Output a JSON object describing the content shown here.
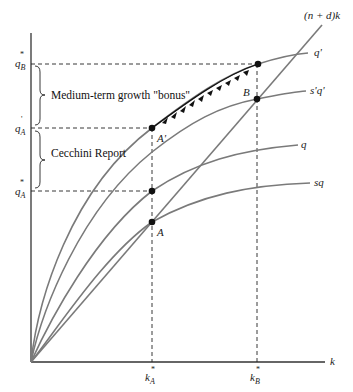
{
  "diagram": {
    "type": "growth-model",
    "axes": {
      "x_label": "k",
      "y_tick_labels": [
        {
          "id": "qB_star",
          "base": "q",
          "sup": "*",
          "sub": "B"
        },
        {
          "id": "qA_prime",
          "base": "q",
          "sup": "'",
          "sub": "A"
        },
        {
          "id": "qA_star",
          "base": "q",
          "sup": "*",
          "sub": "A"
        }
      ],
      "x_tick_labels": [
        {
          "id": "kA_star",
          "base": "k",
          "sup": "*",
          "sub": "A"
        },
        {
          "id": "kB_star",
          "base": "k",
          "sup": "*",
          "sub": "B"
        }
      ]
    },
    "curves": [
      {
        "id": "q_prime",
        "label": "q'"
      },
      {
        "id": "s_prime_q_prime",
        "label": "s'q'"
      },
      {
        "id": "q",
        "label": "q"
      },
      {
        "id": "sq",
        "label": "sq"
      },
      {
        "id": "depreciation_line",
        "label": "(n + d)k"
      }
    ],
    "points": [
      {
        "id": "A",
        "label": "A"
      },
      {
        "id": "A_prime",
        "label": "A'"
      },
      {
        "id": "B",
        "label": "B"
      }
    ],
    "annotations": {
      "bonus": "Medium-term growth \"bonus\"",
      "cecchini": "Cecchini Report"
    },
    "colors": {
      "curve": "#7a7a7a",
      "axis": "#333333",
      "dash": "#222222",
      "point": "#111111"
    }
  }
}
